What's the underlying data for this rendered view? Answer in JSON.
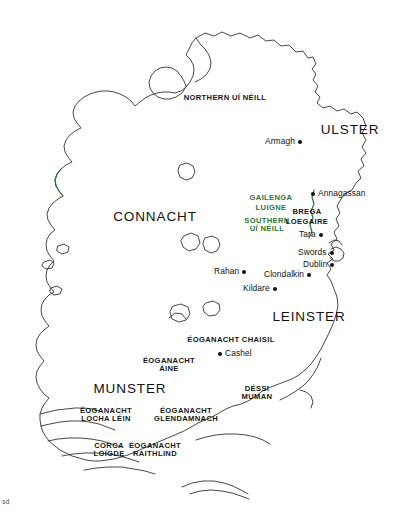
{
  "map": {
    "title": "Map of early medieval Ireland",
    "background_color": "#ffffff",
    "coastline_color": "#333333",
    "highlight_color": "#1f7a32",
    "label_color": "#111111",
    "provinces": [
      {
        "name": "ULSTER",
        "x": 350,
        "y": 131
      },
      {
        "name": "CONNACHT",
        "x": 155,
        "y": 218
      },
      {
        "name": "LEINSTER",
        "x": 309,
        "y": 318
      },
      {
        "name": "MUNSTER",
        "x": 130,
        "y": 390
      }
    ],
    "territories": [
      {
        "name": "NORTHERN UÍ NÉILL",
        "x": 225,
        "y": 98,
        "color": "black",
        "lines": [
          "NORTHERN UÍ NÉILL"
        ]
      },
      {
        "name": "GAILENGA",
        "x": 271,
        "y": 198,
        "color": "green",
        "lines": [
          "GAILENGA"
        ]
      },
      {
        "name": "LUIGNE",
        "x": 271,
        "y": 208,
        "color": "green",
        "lines": [
          "LUIGNE"
        ]
      },
      {
        "name": "SOUTHERN UÍ NÉILL",
        "x": 267,
        "y": 221,
        "color": "green",
        "lines": [
          "SOUTHERN",
          "UÍ NÉILL"
        ]
      },
      {
        "name": "BREGA",
        "x": 307,
        "y": 212,
        "color": "black",
        "lines": [
          "BREGA"
        ]
      },
      {
        "name": "LOEGAIRE",
        "x": 307,
        "y": 222,
        "color": "black",
        "lines": [
          "LOEGAIRE"
        ]
      },
      {
        "name": "ÉOGANACHT CHAISIL",
        "x": 231,
        "y": 340,
        "color": "black",
        "lines": [
          "ÉOGANACHT CHAISIL"
        ]
      },
      {
        "name": "ÉOGANACHT ÁINE",
        "x": 169,
        "y": 361,
        "color": "black",
        "lines": [
          "ÉOGANACHT",
          "ÁINE"
        ]
      },
      {
        "name": "DÉSSI MUMAN",
        "x": 257,
        "y": 389,
        "color": "black",
        "lines": [
          "DÉSSI",
          "MUMAN"
        ]
      },
      {
        "name": "ÉOGANACHT LOCHA LÉIN",
        "x": 106,
        "y": 411,
        "color": "black",
        "lines": [
          "ÉOGANACHT",
          "LOCHA LÉIN"
        ]
      },
      {
        "name": "ÉOGANACHT GLENDAMNACH",
        "x": 186,
        "y": 411,
        "color": "black",
        "lines": [
          "ÉOGANACHT",
          "GLENDAMNACH"
        ]
      },
      {
        "name": "CORCA LOÍGDE",
        "x": 109,
        "y": 446,
        "color": "black",
        "lines": [
          "CORCA",
          "LOÍGDE"
        ]
      },
      {
        "name": "ÉOGANACHT RAITHLIND",
        "x": 155,
        "y": 446,
        "color": "black",
        "lines": [
          "ÉOGANACHT",
          "RAITHLIND"
        ]
      }
    ],
    "settlements": [
      {
        "name": "Armagh",
        "x": 265,
        "y": 141,
        "dot_side": "right"
      },
      {
        "name": "Annagassan",
        "x": 320,
        "y": 193,
        "dot_side": "left"
      },
      {
        "name": "Tara",
        "x": 299,
        "y": 234,
        "dot_side": "right"
      },
      {
        "name": "Swords",
        "x": 300,
        "y": 252,
        "dot_side": "right"
      },
      {
        "name": "Dublin",
        "x": 305,
        "y": 264,
        "dot_side": "right"
      },
      {
        "name": "Clondalkin",
        "x": 273,
        "y": 274,
        "dot_side": "right"
      },
      {
        "name": "Rahan",
        "x": 214,
        "y": 271,
        "dot_side": "right"
      },
      {
        "name": "Kildare",
        "x": 243,
        "y": 288,
        "dot_side": "right"
      },
      {
        "name": "Cashel",
        "x": 218,
        "y": 353,
        "dot_side": "left"
      }
    ],
    "corner_mark": "sd"
  }
}
